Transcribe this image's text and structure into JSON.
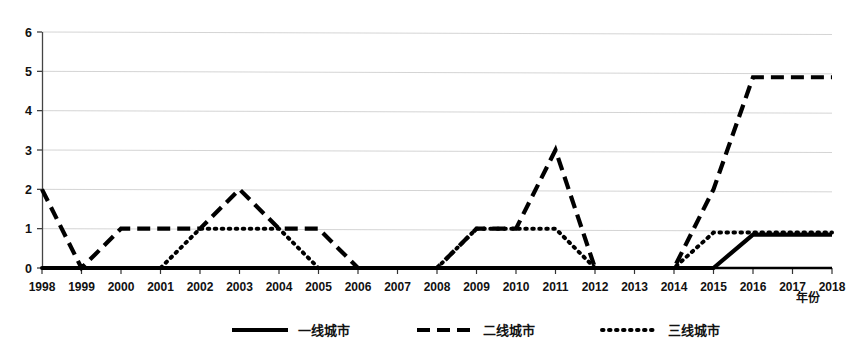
{
  "chart_data": {
    "type": "line",
    "title": "",
    "xlabel": "年份",
    "ylabel": "",
    "xlim": [
      1998,
      2018
    ],
    "ylim": [
      0,
      6
    ],
    "grid": true,
    "legend_position": "bottom",
    "categories": [
      1998,
      1999,
      2000,
      2001,
      2002,
      2003,
      2004,
      2005,
      2006,
      2007,
      2008,
      2009,
      2010,
      2011,
      2012,
      2013,
      2014,
      2015,
      2016,
      2017,
      2018
    ],
    "xtick_labels": [
      "1998",
      "1999",
      "2000",
      "2001",
      "2002",
      "2003",
      "2004",
      "2005",
      "2006",
      "2007",
      "2008",
      "2009",
      "2010",
      "2011",
      "2012",
      "2013",
      "2014",
      "2015",
      "2016",
      "2017",
      "2018"
    ],
    "ytick_labels": [
      "0",
      "1",
      "2",
      "3",
      "4",
      "5",
      "6"
    ],
    "ytick_values": [
      0,
      1,
      2,
      3,
      4,
      5,
      6
    ],
    "series": [
      {
        "name": "一线城市",
        "style": "solid",
        "color": "#000000",
        "values": [
          0,
          0,
          0,
          0,
          0,
          0,
          0,
          0,
          0,
          0,
          0,
          0,
          0,
          0,
          0,
          0,
          0,
          0,
          0.85,
          0.85,
          0.85
        ]
      },
      {
        "name": "二线城市",
        "style": "dashed",
        "color": "#000000",
        "values": [
          2,
          0,
          1,
          1,
          1,
          2,
          1,
          1,
          0,
          0,
          0,
          1,
          1,
          3,
          0,
          0,
          0,
          2,
          4.85,
          4.85,
          4.85
        ]
      },
      {
        "name": "三线城市",
        "style": "dotted",
        "color": "#000000",
        "values": [
          0,
          0,
          0,
          0,
          1,
          1,
          1,
          0,
          0,
          0,
          0,
          1,
          1,
          1,
          0,
          0,
          0,
          0.9,
          0.9,
          0.9,
          0.9
        ]
      }
    ]
  },
  "legend": {
    "items": [
      {
        "label": "一线城市",
        "style": "solid"
      },
      {
        "label": "二线城市",
        "style": "dashed"
      },
      {
        "label": "三线城市",
        "style": "dotted"
      }
    ]
  },
  "axis": {
    "x_title": "年份"
  }
}
